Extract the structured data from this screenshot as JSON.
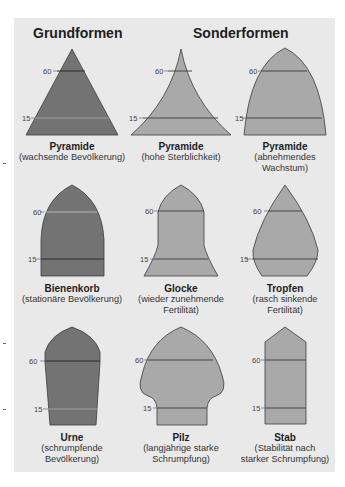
{
  "headings": {
    "basic": "Grundformen",
    "special": "Sonderformen"
  },
  "age_labels": {
    "upper": "60",
    "lower": "15"
  },
  "colors": {
    "panel_bg": "#e9e9e9",
    "dark_fill": "#737373",
    "light_fill": "#a9a9a9",
    "outline": "#3c3c3c"
  },
  "shapes": [
    {
      "id": "pyramide-1",
      "title": "Pyramide",
      "desc": [
        "(wachsende Bevölkerung)"
      ],
      "group": "Grundformen"
    },
    {
      "id": "pyramide-2",
      "title": "Pyramide",
      "desc": [
        "(hohe Sterblichkeit)"
      ],
      "group": "Sonderformen"
    },
    {
      "id": "pyramide-3",
      "title": "Pyramide",
      "desc": [
        "(abnehmendes",
        "Wachstum)"
      ],
      "group": "Sonderformen"
    },
    {
      "id": "bienenkorb",
      "title": "Bienenkorb",
      "desc": [
        "(stationäre Bevölkerung)"
      ],
      "group": "Grundformen"
    },
    {
      "id": "glocke",
      "title": "Glocke",
      "desc": [
        "(wieder zunehmende",
        "Fertilität)"
      ],
      "group": "Sonderformen"
    },
    {
      "id": "tropfen",
      "title": "Tropfen",
      "desc": [
        "(rasch sinkende",
        "Fertilität)"
      ],
      "group": "Sonderformen"
    },
    {
      "id": "urne",
      "title": "Urne",
      "desc": [
        "(schrumpfende",
        "Bevölkerung)"
      ],
      "group": "Grundformen"
    },
    {
      "id": "pilz",
      "title": "Pilz",
      "desc": [
        "(langjährige starke",
        "Schrumpfung)"
      ],
      "group": "Sonderformen"
    },
    {
      "id": "stab",
      "title": "Stab",
      "desc": [
        "(Stabilität nach",
        "starker Schrumpfung)"
      ],
      "group": "Sonderformen"
    }
  ]
}
